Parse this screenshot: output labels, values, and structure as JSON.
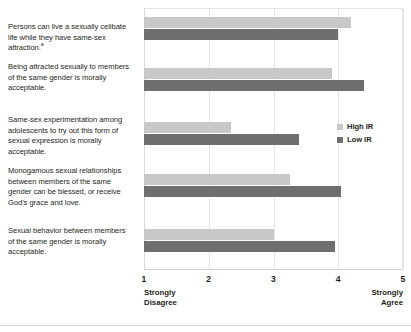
{
  "chart_data": {
    "type": "bar",
    "orientation": "horizontal",
    "title": "",
    "xlabel": "",
    "ylabel": "",
    "xlim": [
      1,
      5
    ],
    "grid": true,
    "legend_position": "right",
    "axis_low_anchor": "Strongly Disagree",
    "axis_high_anchor": "Strongly Agree",
    "tick_labels": [
      "1",
      "2",
      "3",
      "4",
      "5"
    ],
    "tick_values": [
      1,
      2,
      3,
      4,
      5
    ],
    "categories": [
      "Persons can live a sexually celibate life while they have same-sex attraction.",
      "Being attracted sexually to members of the same gender is morally acceptable.",
      "Same-sex experimentation among adolescents to try out this form of sexual expression is morally acceptable.",
      "Monogamous sexual relationships between members of the same gender can be blessed, or receive God's grace and love.",
      "Sexual behavior between members of the same gender is morally acceptable."
    ],
    "category_footnotes": [
      "a",
      "",
      "",
      "",
      ""
    ],
    "series": [
      {
        "name": "High IR",
        "color": "#c8c8c8",
        "values": [
          4.2,
          3.9,
          2.35,
          3.25,
          3.0
        ]
      },
      {
        "name": "Low IR",
        "color": "#6f6f6f",
        "values": [
          4.0,
          4.4,
          3.4,
          4.05,
          3.95
        ]
      }
    ]
  },
  "legend": {
    "items": [
      {
        "label": "High IR"
      },
      {
        "label": "Low IR"
      }
    ]
  },
  "axis": {
    "low_label_line1": "Strongly",
    "low_label_line2": "Disagree",
    "high_label_line1": "Strongly",
    "high_label_line2": "Agree"
  }
}
